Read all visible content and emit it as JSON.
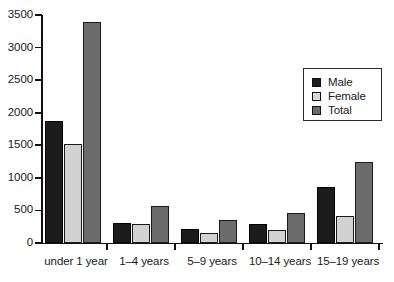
{
  "chart_data": {
    "type": "bar",
    "title": "",
    "subtitle": "",
    "xlabel": "",
    "ylabel": "",
    "categories": [
      "under 1 year",
      "1–4 years",
      "5–9 years",
      "10–14 years",
      "15–19 years"
    ],
    "series": [
      {
        "name": "Male",
        "color": "#1c1c1c",
        "values": [
          1875,
          310,
          210,
          290,
          865
        ]
      },
      {
        "name": "Female",
        "color": "#d2d2d2",
        "values": [
          1520,
          290,
          155,
          200,
          410
        ]
      },
      {
        "name": "Total",
        "color": "#6b6b6b",
        "values": [
          3390,
          570,
          355,
          455,
          1250
        ]
      }
    ],
    "ylim": [
      0,
      3500
    ],
    "ytick_values": [
      0,
      500,
      1000,
      1500,
      2000,
      2500,
      3000,
      3500
    ],
    "ytick_labels": [
      "0",
      "500",
      "1000",
      "1500",
      "2000",
      "2500",
      "3000",
      "3500"
    ],
    "grid": false,
    "legend_position": "upper right",
    "legend_entries": [
      "Male",
      "Female",
      "Total"
    ]
  }
}
